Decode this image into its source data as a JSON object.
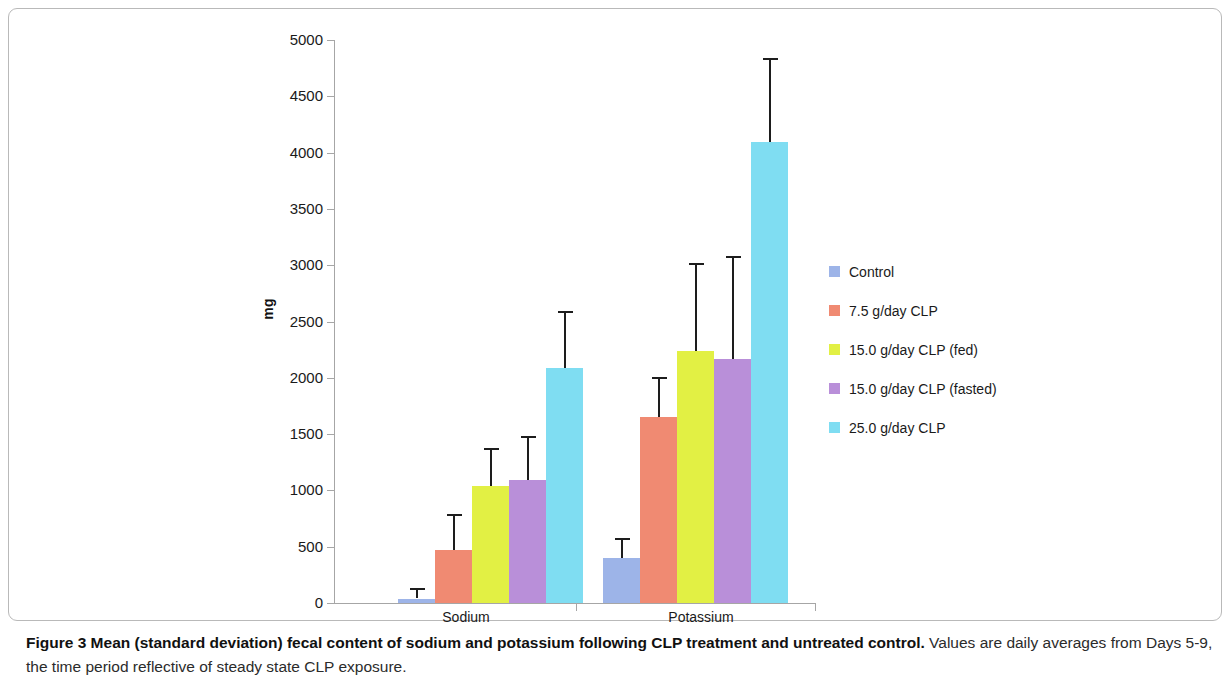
{
  "caption": {
    "bold": "Figure 3 Mean (standard deviation) fecal content of sodium and potassium following CLP treatment and untreated control.",
    "rest": " Values are daily averages from Days 5-9, the time period reflective of steady state CLP exposure."
  },
  "chart_data": {
    "type": "bar",
    "title": "",
    "xlabel": "",
    "ylabel": "mg",
    "ylim": [
      0,
      5000
    ],
    "ytick_step": 500,
    "yticks": [
      0,
      500,
      1000,
      1500,
      2000,
      2500,
      3000,
      3500,
      4000,
      4500,
      5000
    ],
    "grid": false,
    "legend_position": "right",
    "error_bars": "standard deviation (upper cap only shown)",
    "categories": [
      "Sodium",
      "Potassium"
    ],
    "series": [
      {
        "name": "Control",
        "color": "#9DB4E8",
        "values": [
          40,
          400
        ],
        "errors_upper": [
          130,
          580
        ]
      },
      {
        "name": "7.5 g/day CLP",
        "color": "#F08A72",
        "values": [
          470,
          1650
        ],
        "errors_upper": [
          790,
          2010
        ]
      },
      {
        "name": "15.0 g/day CLP (fed)",
        "color": "#E2F044",
        "values": [
          1040,
          2240
        ],
        "errors_upper": [
          1380,
          3020
        ]
      },
      {
        "name": "15.0 g/day CLP (fasted)",
        "color": "#B98FD9",
        "values": [
          1090,
          2170
        ],
        "errors_upper": [
          1480,
          3080
        ]
      },
      {
        "name": "25.0 g/day CLP",
        "color": "#7FDDF2",
        "values": [
          2090,
          4090
        ],
        "errors_upper": [
          2590,
          4840
        ]
      }
    ]
  },
  "geometry": {
    "plot_left": 325,
    "plot_top": 31,
    "plot_bottom": 594,
    "plot_right": 806,
    "bar_width": 37,
    "group_starts": [
      389,
      594
    ],
    "group_separator_x": [
      567,
      806
    ],
    "category_label_x": [
      457,
      692
    ]
  }
}
